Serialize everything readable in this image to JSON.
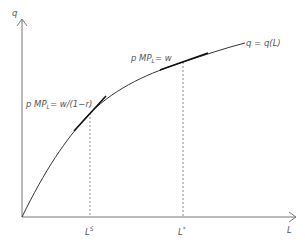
{
  "diagram": {
    "type": "production-function",
    "axes": {
      "y_label": "q",
      "x_label": "L"
    },
    "curve_label": "q = q(L)",
    "tangent_points": [
      {
        "label_prefix": "p MP",
        "label_sub": "L",
        "label_suffix": "= w/(1−r)",
        "x_tick": "L",
        "x_tick_sup": "S"
      },
      {
        "label_prefix": "p MP",
        "label_sub": "L",
        "label_suffix": "= w",
        "x_tick": "L",
        "x_tick_sup": "*"
      }
    ],
    "colors": {
      "axis": "#777777",
      "curve": "#333333",
      "tangent": "#111111",
      "dashed": "#888888",
      "text": "#555555"
    }
  }
}
